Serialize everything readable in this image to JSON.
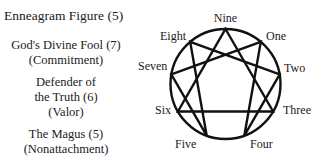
{
  "title": "Enneagram Figure (5)",
  "types": [
    {
      "name": "God's Divine Fool (7)",
      "virtue": "(Commitment)"
    },
    {
      "name_line1": "Defender of",
      "name_line2": "the Truth (6)",
      "virtue": "(Valor)"
    },
    {
      "name": "The Magus (5)",
      "virtue": "(Nonattachment)"
    }
  ],
  "diagram": {
    "labels": {
      "nine": "Nine",
      "one": "One",
      "two": "Two",
      "three": "Three",
      "four": "Four",
      "five": "Five",
      "six": "Six",
      "seven": "Seven",
      "eight": "Eight"
    },
    "stroke_color": "#111111"
  }
}
